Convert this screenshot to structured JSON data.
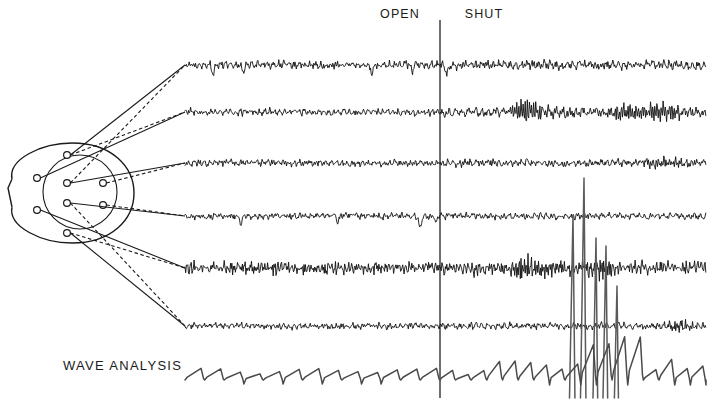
{
  "figure": {
    "title_labels": {
      "open": "OPEN",
      "shut": "SHUT",
      "wave_analysis": "WAVE ANALYSIS"
    },
    "colors": {
      "background": "#ffffff",
      "trace": "#101010",
      "wave_trace": "#4a4a4a",
      "divider": "#4a4a4a",
      "head": "#1a1a1a",
      "text": "#1a1a1a"
    }
  },
  "chart_data": {
    "type": "line",
    "title": "",
    "xlabel": "",
    "ylabel": "",
    "grid": false,
    "legend_position": "none",
    "annotations": [
      {
        "label": "OPEN",
        "x": 400,
        "y": 18,
        "description": "eyes open condition, left of divider"
      },
      {
        "label": "SHUT",
        "x": 482,
        "y": 18,
        "description": "eyes shut condition, right of divider"
      },
      {
        "label": "WAVE ANALYSIS",
        "x": 63,
        "y": 370,
        "description": "row label for bottom integrated trace"
      }
    ],
    "event_marker": {
      "label": "eyes-shut transition",
      "x": 440,
      "y_top": 20,
      "y_bottom": 398
    },
    "x_axis": {
      "trace_start_px": 185,
      "trace_end_px": 706,
      "condition_split_px": 440
    },
    "series": [
      {
        "name": "channel-1",
        "baseline_y": 65,
        "open_amplitude": 3.0,
        "shut_amplitude": 3.6,
        "open_frequency": 14,
        "shut_frequency": 13,
        "seed": 11,
        "artifacts": [
          {
            "type": "blink",
            "x": 213,
            "depth": 9
          },
          {
            "type": "blink",
            "x": 243,
            "depth": 7
          },
          {
            "type": "blink",
            "x": 372,
            "depth": 8
          },
          {
            "type": "blink",
            "x": 412,
            "depth": 7
          },
          {
            "type": "blink",
            "x": 447,
            "depth": 9
          }
        ],
        "bursts": []
      },
      {
        "name": "channel-2",
        "baseline_y": 112,
        "open_amplitude": 2.6,
        "shut_amplitude": 4.0,
        "open_frequency": 15,
        "shut_frequency": 11,
        "seed": 27,
        "artifacts": [],
        "bursts": [
          {
            "start": 505,
            "end": 560,
            "amplitude": 10.5,
            "frequency": 10
          },
          {
            "start": 600,
            "end": 690,
            "amplitude": 9.0,
            "frequency": 10
          }
        ]
      },
      {
        "name": "channel-3",
        "baseline_y": 163,
        "open_amplitude": 2.6,
        "shut_amplitude": 3.0,
        "open_frequency": 14,
        "shut_frequency": 13,
        "seed": 43,
        "artifacts": [],
        "bursts": [
          {
            "start": 640,
            "end": 700,
            "amplitude": 5.0,
            "frequency": 11
          }
        ]
      },
      {
        "name": "channel-4",
        "baseline_y": 216,
        "open_amplitude": 2.4,
        "shut_amplitude": 2.6,
        "open_frequency": 13,
        "shut_frequency": 12,
        "seed": 61,
        "artifacts": [
          {
            "type": "blink",
            "x": 241,
            "depth": 8
          },
          {
            "type": "blink",
            "x": 338,
            "depth": 7
          },
          {
            "type": "blink",
            "x": 420,
            "depth": 12
          },
          {
            "type": "blink",
            "x": 436,
            "depth": 6
          }
        ],
        "bursts": []
      },
      {
        "name": "channel-5",
        "baseline_y": 268,
        "open_amplitude": 5.0,
        "shut_amplitude": 5.5,
        "open_frequency": 22,
        "shut_frequency": 20,
        "seed": 79,
        "artifacts": [],
        "bursts": [
          {
            "start": 498,
            "end": 560,
            "amplitude": 9.5,
            "frequency": 18
          },
          {
            "start": 575,
            "end": 625,
            "amplitude": 8.5,
            "frequency": 18
          }
        ]
      },
      {
        "name": "channel-6",
        "baseline_y": 326,
        "open_amplitude": 2.4,
        "shut_amplitude": 2.8,
        "open_frequency": 14,
        "shut_frequency": 13,
        "seed": 97,
        "artifacts": [],
        "bursts": [
          {
            "start": 660,
            "end": 700,
            "amplitude": 5.5,
            "frequency": 12
          }
        ]
      }
    ],
    "spikes": [
      {
        "x": 573,
        "top_y": 215,
        "bottom_y": 398,
        "width": 3.5
      },
      {
        "x": 584,
        "top_y": 178,
        "bottom_y": 398,
        "width": 3.5
      },
      {
        "x": 596,
        "top_y": 238,
        "bottom_y": 398,
        "width": 3.0
      },
      {
        "x": 606,
        "top_y": 246,
        "bottom_y": 398,
        "width": 3.0
      },
      {
        "x": 617,
        "top_y": 286,
        "bottom_y": 398,
        "width": 2.6
      }
    ],
    "wave_analysis": {
      "name": "wave-analysis",
      "baseline_y": 380,
      "description": "integrated amplitude histogram, sawtooth ramps with periodic resets",
      "open_ramp_height": 10,
      "shut_ramp_height": 17,
      "open_segment_count": 13,
      "shut_segment_count": 17,
      "tall_spike_region": {
        "start": 575,
        "end": 640,
        "height": 40
      }
    },
    "head_diagram": {
      "name": "head-schematic",
      "center_x": 72,
      "center_y": 193,
      "radius_x": 62,
      "radius_y": 50,
      "inner_circle": {
        "cx": 80,
        "cy": 192,
        "r": 37
      },
      "nose": {
        "tip_x": 8,
        "y": 190
      },
      "electrodes": [
        {
          "id": "e1",
          "x": 37,
          "y": 178
        },
        {
          "id": "e2",
          "x": 37,
          "y": 210
        },
        {
          "id": "e3",
          "x": 67,
          "y": 155
        },
        {
          "id": "e4",
          "x": 67,
          "y": 183
        },
        {
          "id": "e5",
          "x": 67,
          "y": 203
        },
        {
          "id": "e6",
          "x": 67,
          "y": 233
        },
        {
          "id": "e7",
          "x": 103,
          "y": 183
        },
        {
          "id": "e8",
          "x": 103,
          "y": 205
        }
      ],
      "lead_count": 12
    }
  }
}
